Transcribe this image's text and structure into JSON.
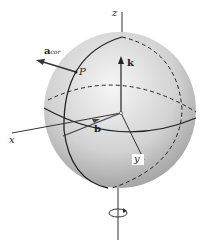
{
  "diagram": {
    "labels": {
      "z_axis": "z",
      "x_axis": "x",
      "y_axis": "y",
      "k_vector": "k",
      "b_vector": "b",
      "point": "P",
      "a_cor_main": "a",
      "a_cor_sub": "cor"
    },
    "colors": {
      "sphere_light": "#f4f4f4",
      "sphere_dark": "#9a9a9a",
      "line": "#222222"
    }
  }
}
